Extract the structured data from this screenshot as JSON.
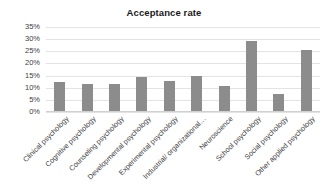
{
  "chart_data": {
    "type": "bar",
    "title": "Acceptance rate",
    "xlabel": "",
    "ylabel": "",
    "ylim": [
      0,
      35
    ],
    "grid": true,
    "legend": false,
    "value_suffix": "%",
    "bar_color": "#8c8c8c",
    "categories": [
      "Clinical psychology",
      "Cognitive psychology",
      "Counseling psychology",
      "Developmental psychology",
      "Experimental psychology",
      "Industrial/ organizational…",
      "Neuroscience",
      "School psychology",
      "Social psychology",
      "Other applied psychology"
    ],
    "values": [
      12,
      11,
      11,
      14,
      12.5,
      14.5,
      10.5,
      29,
      7,
      25
    ],
    "ytick_labels": [
      "0%",
      "5%",
      "10%",
      "15%",
      "20%",
      "25%",
      "30%",
      "35%"
    ],
    "ytick_values": [
      0,
      5,
      10,
      15,
      20,
      25,
      30,
      35
    ]
  }
}
